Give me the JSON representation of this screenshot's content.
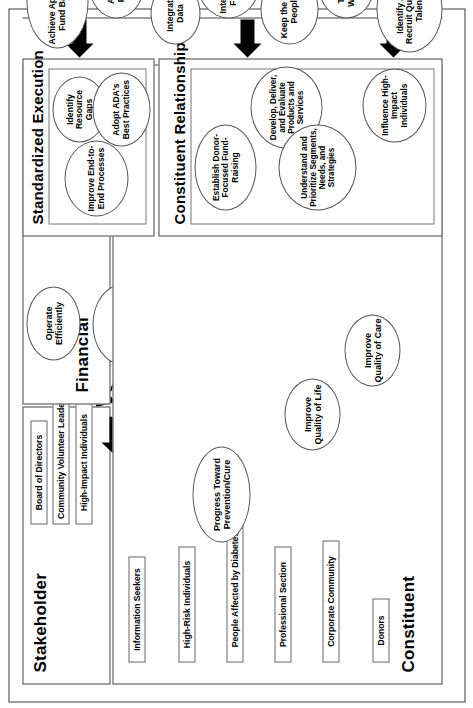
{
  "diagram": {
    "orientation": "rotated-90-ccw",
    "type": "strategy-map"
  },
  "panels": {
    "stakeholder": {
      "title": "Stakeholder",
      "chips": [
        {
          "label": "Board of Directors"
        },
        {
          "label": "Community Volunteer Leadership"
        },
        {
          "label": "High-Impact Individuals"
        }
      ]
    },
    "constituent": {
      "title": "Constituent",
      "chips": [
        {
          "label": "Information Seekers"
        },
        {
          "label": "High-Risk Individuals"
        },
        {
          "label": "People Affected by Diabetes"
        },
        {
          "label": "Professional Section"
        },
        {
          "label": "Corporate Community"
        },
        {
          "label": "Donors"
        }
      ],
      "objectives": [
        {
          "label": "Progress Toward Prevention/Cure"
        },
        {
          "label": "Improve Quality of Life"
        },
        {
          "label": "Improve Quality of Care"
        }
      ]
    },
    "financial": {
      "title": "Financial",
      "objectives": [
        {
          "label": "Operate Efficiently"
        },
        {
          "label": "Increase Net Margin"
        },
        {
          "label": "Grow Revenues"
        }
      ]
    },
    "standardized_execution": {
      "title": "Standardized Execution",
      "objectives": [
        {
          "label": "Identify Resource Gaps"
        },
        {
          "label": "Improve End-to-End Processes"
        },
        {
          "label": "Adopt ADA's Best Practices"
        }
      ]
    },
    "crm": {
      "title": "Constituent Relationship Management",
      "objectives": [
        {
          "label": "Establish Donor-Focused Fund-Raising"
        },
        {
          "label": "Develop, Deliver, and Evaluate Products and Services"
        },
        {
          "label": "Understand and Prioritize Segments, Needs, and Strategies"
        },
        {
          "label": "Influence High-Impact Individuals"
        }
      ]
    },
    "enablers": {
      "title": "Enablers",
      "objectives": [
        {
          "label": "Achieve Appropriate Fund Balance"
        },
        {
          "label": "Align with Priorities"
        },
        {
          "label": "Integrate Data"
        },
        {
          "label": "Integrate Cross-Functionally"
        },
        {
          "label": "Keep the Best People"
        },
        {
          "label": "Train the Workforce"
        },
        {
          "label": "Identify and Recruit Qualified Talent"
        }
      ]
    }
  },
  "colors": {
    "outline": "#444444",
    "ellipse_outline": "#555555",
    "chip_outline": "#666666",
    "arrow_fill": "#000000",
    "background": "#ffffff"
  }
}
